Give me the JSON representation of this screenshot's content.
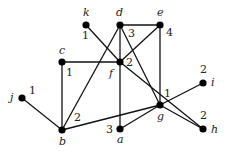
{
  "graph": {
    "nodes": [
      {
        "id": "k",
        "x": 86,
        "y": 25,
        "value": "1",
        "lx": 83,
        "ly": 16,
        "vx": 82,
        "vy": 39
      },
      {
        "id": "d",
        "x": 120,
        "y": 25,
        "value": "3",
        "lx": 116,
        "ly": 16,
        "vx": 128,
        "vy": 37
      },
      {
        "id": "e",
        "x": 160,
        "y": 25,
        "value": "4",
        "lx": 157,
        "ly": 16,
        "vx": 166,
        "vy": 36
      },
      {
        "id": "c",
        "x": 62,
        "y": 62,
        "value": "1",
        "lx": 59,
        "ly": 54,
        "vx": 66,
        "vy": 76
      },
      {
        "id": "f",
        "x": 120,
        "y": 62,
        "value": "2",
        "lx": 109,
        "ly": 77,
        "vx": 126,
        "vy": 66
      },
      {
        "id": "g",
        "x": 160,
        "y": 105,
        "value": "1",
        "lx": 157,
        "ly": 120,
        "vx": 164,
        "vy": 97
      },
      {
        "id": "i",
        "x": 203,
        "y": 83,
        "value": "2",
        "lx": 211,
        "ly": 86,
        "vx": 200,
        "vy": 73
      },
      {
        "id": "h",
        "x": 203,
        "y": 129,
        "value": "2",
        "lx": 211,
        "ly": 133,
        "vx": 200,
        "vy": 119
      },
      {
        "id": "a",
        "x": 120,
        "y": 129,
        "value": "3",
        "lx": 117,
        "ly": 143,
        "vx": 106,
        "vy": 133
      },
      {
        "id": "b",
        "x": 62,
        "y": 130,
        "value": "2",
        "lx": 59,
        "ly": 145,
        "vx": 74,
        "vy": 121
      },
      {
        "id": "j",
        "x": 22,
        "y": 98,
        "value": "1",
        "lx": 10,
        "ly": 101,
        "vx": 29,
        "vy": 94
      }
    ],
    "edges": [
      [
        "k",
        "f"
      ],
      [
        "d",
        "e"
      ],
      [
        "d",
        "f"
      ],
      [
        "d",
        "g"
      ],
      [
        "d",
        "b"
      ],
      [
        "e",
        "f"
      ],
      [
        "e",
        "g"
      ],
      [
        "c",
        "f"
      ],
      [
        "c",
        "b"
      ],
      [
        "f",
        "a"
      ],
      [
        "f",
        "h"
      ],
      [
        "b",
        "j"
      ],
      [
        "b",
        "g"
      ],
      [
        "a",
        "g"
      ],
      [
        "g",
        "i"
      ],
      [
        "g",
        "h"
      ]
    ]
  }
}
